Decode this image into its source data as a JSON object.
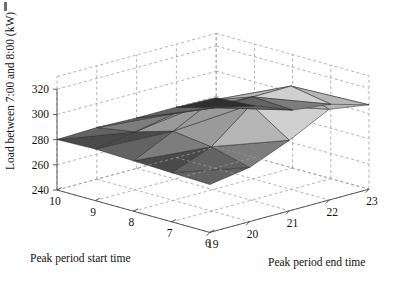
{
  "figure": {
    "title": "",
    "background_color": "#ffffff",
    "width": 411,
    "height": 292,
    "corner_mark": ""
  },
  "chart_data": {
    "type": "surface",
    "render_style": "3d-faceted-surface-grayscale",
    "title": "",
    "xlabel": "Peak period start time",
    "ylabel": "Peak period end time",
    "zlabel": "Load between 7:00 and 8:00 (kW)",
    "x_ticks": [
      10,
      9,
      8,
      7,
      6
    ],
    "y_ticks": [
      19,
      20,
      21,
      22,
      23
    ],
    "z_ticks": [
      240,
      260,
      280,
      300,
      320
    ],
    "xlim": [
      10,
      6
    ],
    "ylim": [
      19,
      23
    ],
    "zlim": [
      235,
      330
    ],
    "grid": true,
    "grid_style": "dashed",
    "legend": "none",
    "x": [
      10,
      9,
      8,
      7,
      6
    ],
    "y": [
      19,
      20,
      21,
      22,
      23
    ],
    "z": [
      [
        280,
        281,
        280,
        280,
        279
      ],
      [
        281,
        286,
        292,
        288,
        281
      ],
      [
        280,
        295,
        311,
        305,
        286
      ],
      [
        279,
        291,
        316,
        322,
        299
      ],
      [
        278,
        283,
        296,
        312,
        307
      ]
    ],
    "z_note": "rows indexed by peak period start time (10 to 6), columns by peak period end time (19 to 23)",
    "colormap": "gray",
    "facet_fill_levels": [
      "#2f2f2f",
      "#4a4a4a",
      "#636363",
      "#7d7d7d",
      "#9a9a9a",
      "#b5b5b5",
      "#cfcfcf",
      "#e6e6e6",
      "#f7f7f7"
    ]
  },
  "axes": {
    "z_axis": {
      "label": "Load between 7:00 and 8:00 (kW)",
      "ticks": [
        "320",
        "300",
        "280",
        "260",
        "240"
      ]
    },
    "x_axis": {
      "label": "Peak period start time",
      "ticks": [
        "10",
        "9",
        "8",
        "7",
        "6"
      ]
    },
    "y_axis": {
      "label": "Peak period end time",
      "ticks": [
        "19",
        "20",
        "21",
        "22",
        "23"
      ]
    }
  }
}
